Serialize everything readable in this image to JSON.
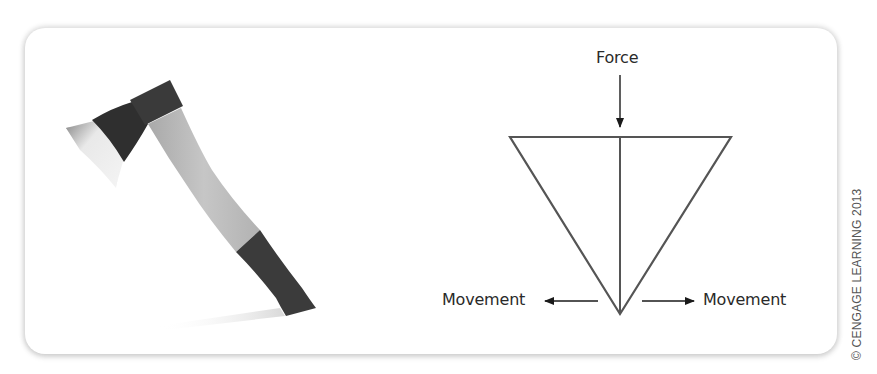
{
  "figure": {
    "left_image": {
      "subject": "hatchet",
      "colors": {
        "blade_edge": "#d9d9d9",
        "blade_head": "#2f2f2f",
        "collar": "#3a3a3a",
        "handle": "#bdbdbd",
        "grip": "#3b3b3b",
        "shadow": "#d6d6d6"
      }
    },
    "wedge_diagram": {
      "shape": "inverted-triangle-wedge",
      "labels": {
        "force": "Force",
        "movement_left": "Movement",
        "movement_right": "Movement"
      },
      "line_color": "#555555",
      "arrow_color": "#1a1a1a"
    },
    "credit": "© CENGAGE LEARNING 2013"
  }
}
